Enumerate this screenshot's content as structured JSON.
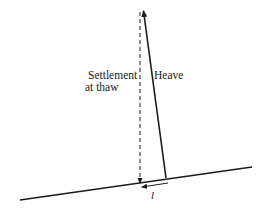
{
  "diagram": {
    "type": "frost-creep-schematic",
    "labels": {
      "settlement_line1": "Settlement",
      "settlement_line2": "at thaw",
      "heave": "Heave",
      "displacement": "l"
    },
    "colors": {
      "stroke": "#1a1a1a",
      "text": "#222222",
      "background": "#ffffff"
    },
    "elements": {
      "slope_surface": {
        "x1": 20,
        "y1": 200,
        "x2": 252,
        "y2": 167
      },
      "heave_vector": {
        "x1": 166,
        "y1": 178,
        "x2": 143,
        "y2": 10
      },
      "settlement_vector": {
        "x1": 140,
        "y1": 12,
        "x2": 140,
        "y2": 184
      },
      "net_displacement": {
        "x1": 167,
        "y1": 183,
        "x2": 141,
        "y2": 187
      }
    }
  }
}
